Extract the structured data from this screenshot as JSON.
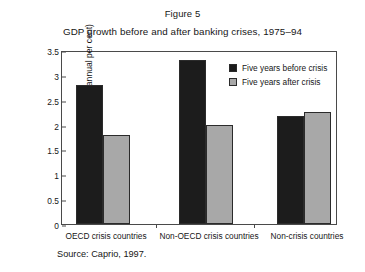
{
  "figure": {
    "label": "Figure 5",
    "title": "GDP growth before and after banking crises, 1975–94",
    "source": "Source: Caprio, 1997."
  },
  "colors": {
    "before_crisis": "#1c1c1c",
    "after_crisis": "#a8a8a8",
    "axis": "#4a4a4a",
    "background": "#ffffff"
  },
  "chart_data": {
    "type": "bar",
    "title": "GDP growth before and after banking crises, 1975–94",
    "xlabel": "",
    "ylabel": "Mean GDP growth (annual per cent)",
    "ylim": [
      0,
      3.5
    ],
    "yticks": [
      "0",
      "0.5",
      "1",
      "1.5",
      "2",
      "2.5",
      "3",
      "3.5"
    ],
    "ytick_values": [
      0,
      0.5,
      1,
      1.5,
      2,
      2.5,
      3,
      3.5
    ],
    "grid": false,
    "legend_position": "top-right inside plot",
    "categories": [
      "OECD crisis countries",
      "Non-OECD crisis countries",
      "Non-crisis countries"
    ],
    "series": [
      {
        "name": "Five years before crisis",
        "color": "#1c1c1c",
        "values": [
          2.8,
          3.3,
          2.17
        ]
      },
      {
        "name": "Five years after crisis",
        "color": "#a8a8a8",
        "values": [
          1.8,
          2.0,
          2.25
        ]
      }
    ]
  }
}
